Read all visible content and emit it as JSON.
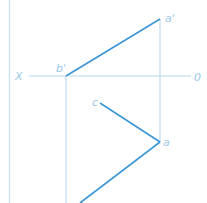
{
  "diagram": {
    "type": "orthographic-projection",
    "colors": {
      "thin_line": "#b9d9f0",
      "thick_line": "#3c96d6",
      "label": "#9cc8e8",
      "border": "#c6dff2"
    },
    "labels": {
      "x_axis_left": "X",
      "x_axis_right": "0",
      "b_prime": "b'",
      "a_prime": "a'",
      "c": "c",
      "a": "a"
    },
    "points": {
      "b_prime": [
        66,
        76
      ],
      "a_prime": [
        160,
        19
      ],
      "c": [
        100,
        103
      ],
      "a": [
        160,
        142
      ],
      "b_bottom": [
        80,
        203
      ]
    }
  }
}
